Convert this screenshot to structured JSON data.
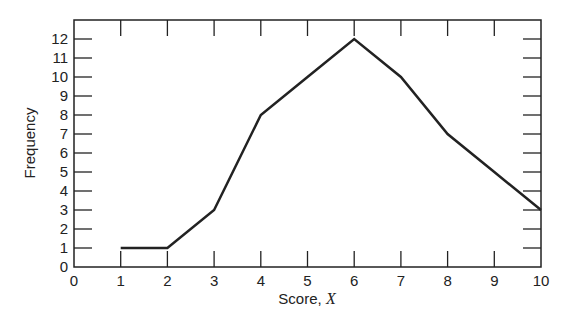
{
  "chart_data": {
    "type": "line",
    "title": "",
    "xlabel": "Score, X",
    "xlabel_text": "Score, ",
    "xlabel_var": "X",
    "ylabel": "Frequency",
    "x": [
      1,
      2,
      3,
      4,
      5,
      6,
      7,
      8,
      9,
      10
    ],
    "series": [
      {
        "name": "Frequency",
        "values": [
          1,
          1,
          3,
          8,
          10,
          12,
          10,
          7,
          5,
          3
        ]
      }
    ],
    "xlim": [
      0,
      10
    ],
    "ylim": [
      0,
      12
    ],
    "x_ticks": [
      0,
      1,
      2,
      3,
      4,
      5,
      6,
      7,
      8,
      9,
      10
    ],
    "y_ticks": [
      0,
      1,
      2,
      3,
      4,
      5,
      6,
      7,
      8,
      9,
      10,
      11,
      12
    ],
    "grid": false,
    "legend": null,
    "line_color": "#222222"
  }
}
